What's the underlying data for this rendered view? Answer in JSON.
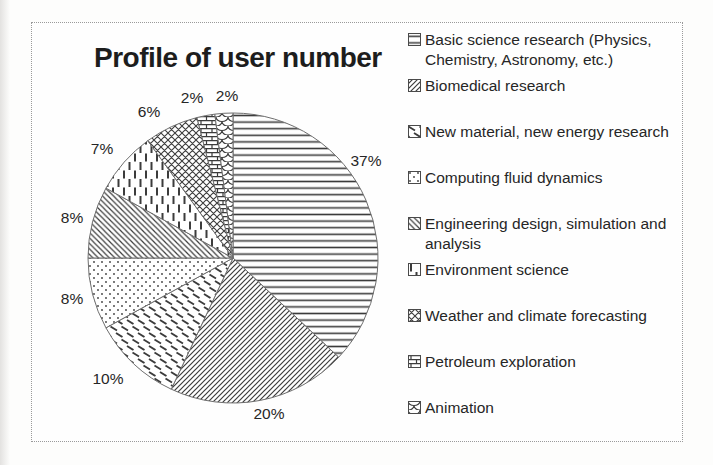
{
  "chart_data": {
    "type": "pie",
    "title": "Profile of user number",
    "legend_position": "right",
    "start_angle_deg": 0,
    "direction": "clockwise",
    "stroke_color": "#6e6e6e",
    "pattern_color": "#3c3c3c",
    "slices": [
      {
        "label": "Basic science research (Physics, Chemistry, Astronomy, etc.)",
        "value": 37,
        "pct_label": "37%",
        "pattern": "horizontal-lines"
      },
      {
        "label": "Biomedical research",
        "value": 20,
        "pct_label": "20%",
        "pattern": "diagonal-forward-hatch"
      },
      {
        "label": "New material, new energy research",
        "value": 10,
        "pct_label": "10%",
        "pattern": "diagonal-dashes"
      },
      {
        "label": "Computing fluid dynamics",
        "value": 8,
        "pct_label": "8%",
        "pattern": "dots"
      },
      {
        "label": "Engineering design, simulation and analysis",
        "value": 8,
        "pct_label": "8%",
        "pattern": "diagonal-back-hatch"
      },
      {
        "label": "Environment science",
        "value": 7,
        "pct_label": "7%",
        "pattern": "vertical-dashes"
      },
      {
        "label": "Weather and climate forecasting",
        "value": 6,
        "pct_label": "6%",
        "pattern": "crosshatch"
      },
      {
        "label": "Petroleum exploration",
        "value": 2,
        "pct_label": "2%",
        "pattern": "brick"
      },
      {
        "label": "Animation",
        "value": 2,
        "pct_label": "2%",
        "pattern": "scales"
      }
    ]
  }
}
